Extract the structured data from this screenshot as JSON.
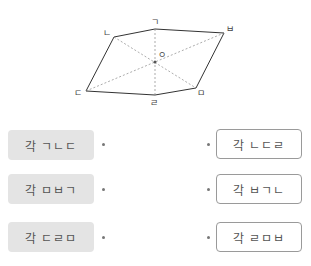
{
  "figure": {
    "vertices": {
      "giyeok": {
        "label": "ㄱ",
        "x": 155,
        "y": 29
      },
      "bieup": {
        "label": "ㅂ",
        "x": 224,
        "y": 33
      },
      "nieun": {
        "label": "ㄴ",
        "x": 114,
        "y": 37
      },
      "digeut": {
        "label": "ㄷ",
        "x": 86,
        "y": 91
      },
      "rieul": {
        "label": "ㄹ",
        "x": 155,
        "y": 95
      },
      "mieum": {
        "label": "ㅁ",
        "x": 196,
        "y": 88
      },
      "center": {
        "label": "ㅇ",
        "x": 155,
        "y": 62
      }
    }
  },
  "matching": {
    "left": [
      {
        "label": "각 ㄱㄴㄷ"
      },
      {
        "label": "각 ㅁㅂㄱ"
      },
      {
        "label": "각 ㄷㄹㅁ"
      }
    ],
    "right": [
      {
        "label": "각 ㄴㄷㄹ"
      },
      {
        "label": "각 ㅂㄱㄴ"
      },
      {
        "label": "각 ㄹㅁㅂ"
      }
    ]
  }
}
